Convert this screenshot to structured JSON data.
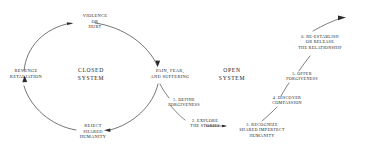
{
  "diagram": {
    "ink_color": "#1a1a1a",
    "background": "#ffffff",
    "closed_system": {
      "center_label": "CLOSED\nSYSTEM",
      "nodes": [
        {
          "id": "violence",
          "label": "VIOLENCE\nOR\nHURT"
        },
        {
          "id": "pain",
          "label": "PAIN, FEAR,\nAND SUFFERING"
        },
        {
          "id": "reject",
          "label": "REJECT\nSHARED\nHUMANITY"
        },
        {
          "id": "revenge",
          "label": "REVENGE\nRETALIATION"
        }
      ]
    },
    "open_system": {
      "center_label": "OPEN\nSYSTEM",
      "steps": [
        {
          "number": "1.",
          "label": "1. DEFINE\nFORGIVENESS"
        },
        {
          "number": "2.",
          "label": "2. EXPLORE\nTHE STORIES"
        },
        {
          "number": "3.",
          "label": "3. RECOGNIZE\nSHARED IMPERFECT\nHUMANITY"
        },
        {
          "number": "4.",
          "label": "4. DISCOVER\nCOMPASSION"
        },
        {
          "number": "5.",
          "label": "5. OFFER\nFORGIVENESS"
        },
        {
          "number": "6.",
          "label": "6. RE-ESTABLISH\nOR RELEASE\nTHE RELATIONSHIP"
        }
      ]
    }
  }
}
